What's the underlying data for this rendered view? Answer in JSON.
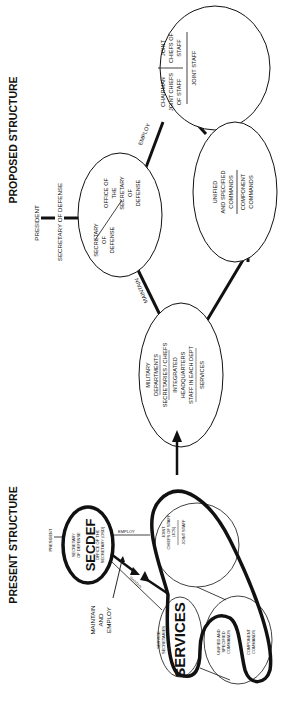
{
  "proposed": {
    "title": "PROPOSED STRUCTURE",
    "president": "PRESIDENT",
    "secdef_label": "SECRETARY OF DEFENSE",
    "osd_node": {
      "left": [
        "SECRETARY",
        "OF",
        "DEFENSE"
      ],
      "right": [
        "OFFICE OF",
        "THE",
        "SECRETARY",
        "OF",
        "DEFENSE"
      ]
    },
    "jcs_node": {
      "left": [
        "CHAIRMAN",
        "JOINT CHIEFS",
        "OF STAFF"
      ],
      "right_top": [
        "JOINT",
        "CHIEFS OF",
        "STAFF"
      ],
      "right_bottom": "JOINT STAFF"
    },
    "unified_node": {
      "top": [
        "UNIFIED",
        "AND SPECIFIED",
        "COMMANDS"
      ],
      "bottom": [
        "COMPONENT",
        "COMMANDS"
      ]
    },
    "military_node": {
      "lines": [
        "MILITARY",
        "DEPARTMENTS",
        "SECRETARIES / CHIEFS",
        "INTEGRATED",
        "HEADQUARTERS",
        "STAFF IN EACH DEPT",
        "SERVICES"
      ]
    },
    "edge_labels": {
      "employ": "EMPLOY",
      "maintain": "MAINTAIN"
    }
  },
  "present": {
    "title": "PRESENT STRUCTURE",
    "president": "PRESIDENT",
    "secdef_node": {
      "big": "SECDEF",
      "small": [
        "SECRETARY",
        "OF DEFENSE",
        "OFFICE OF THE",
        "SECRETARY (OSD)"
      ]
    },
    "jcs_node": {
      "top": [
        "JOINT",
        "CHIEFS OF STAFF",
        "(JCS)"
      ],
      "bottom": "JOINT STAFF"
    },
    "services_node": {
      "big": "SERVICES",
      "small": [
        "SERVICE",
        "SECRETARIES"
      ]
    },
    "unified_node": {
      "top": [
        "UNIFIED AND",
        "SPECIFIED",
        "COMMANDS"
      ],
      "bottom": [
        "COMPONENT",
        "COMMANDS"
      ]
    },
    "edge_labels": {
      "employ": "EMPLOY",
      "maintain_small": "MAINTAIN"
    },
    "callout": [
      "MAINTAIN",
      "AND",
      "EMPLOY"
    ]
  },
  "colors": {
    "ink": "#111111",
    "paper": "#ffffff"
  }
}
